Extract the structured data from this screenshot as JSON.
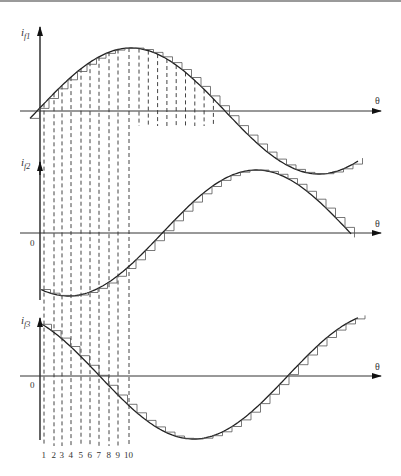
{
  "figure": {
    "panels": [
      {
        "id": "if1",
        "y_label": "i",
        "y_label_sub": "f1",
        "x_label": "θ",
        "origin_label": "",
        "description": "sinusoidal current with staircase approximation, starts at zero rising"
      },
      {
        "id": "if2",
        "y_label": "i",
        "y_label_sub": "f2",
        "x_label": "θ",
        "origin_label": "0",
        "description": "sinusoidal current phase shifted, starts negative"
      },
      {
        "id": "if3",
        "y_label": "i",
        "y_label_sub": "f3",
        "x_label": "θ",
        "origin_label": "0",
        "description": "sinusoidal current phase shifted, starts positive falling"
      }
    ],
    "step_labels": [
      "1",
      "2",
      "3",
      "4",
      "5",
      "6",
      "7",
      "8",
      "9",
      "10"
    ],
    "colors": {
      "line": "#222222",
      "axis": "#333333",
      "dash": "#444444",
      "step": "#555555"
    }
  }
}
